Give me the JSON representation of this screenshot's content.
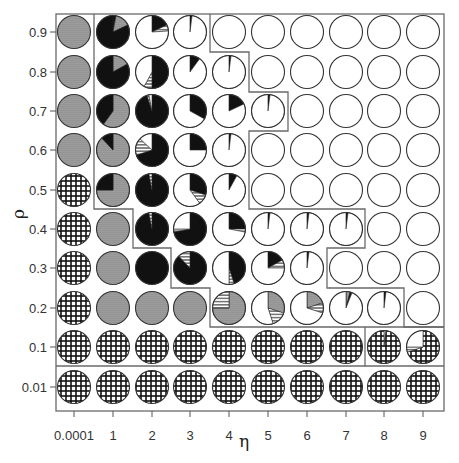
{
  "chart_data": {
    "type": "pie-grid",
    "title": "",
    "xlabel": "η",
    "ylabel": "ρ",
    "x_ticks": [
      "0.0001",
      "1",
      "2",
      "3",
      "4",
      "5",
      "6",
      "7",
      "8",
      "9"
    ],
    "y_ticks": [
      "0.9",
      "0.8",
      "0.7",
      "0.6",
      "0.5",
      "0.4",
      "0.3",
      "0.2",
      "0.1",
      "0.01"
    ],
    "grid": false,
    "legend": null,
    "categories_legend": {
      "white": "open/white slice",
      "black": "solid black slice",
      "gray": "gray slice",
      "hstripe": "horizontal-striped slice",
      "cross": "cross-hatched slice"
    },
    "colors": {
      "white": "#ffffff",
      "black": "#111111",
      "gray": "#9a9a9a",
      "stroke": "#333333",
      "frame": "#666666"
    },
    "note": "Each cell is a pie; slices listed clockwise from 12 o'clock as [category, fraction].",
    "rows": [
      [
        [
          [
            "gray",
            1
          ]
        ],
        [
          [
            "black",
            0.03
          ],
          [
            "gray",
            0.15
          ],
          [
            "black",
            0.82
          ]
        ],
        [
          [
            "black",
            0.18
          ],
          [
            "hstripe",
            0.06
          ],
          [
            "white",
            0.76
          ]
        ],
        [
          [
            "black",
            0.02
          ],
          [
            "white",
            0.98
          ]
        ],
        [
          [
            "white",
            1
          ]
        ],
        [
          [
            "white",
            1
          ]
        ],
        [
          [
            "white",
            1
          ]
        ],
        [
          [
            "white",
            1
          ]
        ],
        [
          [
            "white",
            1
          ]
        ],
        [
          [
            "white",
            1
          ]
        ]
      ],
      [
        [
          [
            "gray",
            1
          ]
        ],
        [
          [
            "gray",
            0.17
          ],
          [
            "black",
            0.83
          ]
        ],
        [
          [
            "black",
            0.5
          ],
          [
            "hstripe",
            0.08
          ],
          [
            "white",
            0.42
          ]
        ],
        [
          [
            "black",
            0.1
          ],
          [
            "white",
            0.9
          ]
        ],
        [
          [
            "black",
            0.02
          ],
          [
            "white",
            0.98
          ]
        ],
        [
          [
            "white",
            1
          ]
        ],
        [
          [
            "white",
            1
          ]
        ],
        [
          [
            "white",
            1
          ]
        ],
        [
          [
            "white",
            1
          ]
        ],
        [
          [
            "white",
            1
          ]
        ]
      ],
      [
        [
          [
            "gray",
            1
          ]
        ],
        [
          [
            "gray",
            0.6
          ],
          [
            "black",
            0.4
          ]
        ],
        [
          [
            "black",
            0.95
          ],
          [
            "hstripe",
            0.02
          ],
          [
            "white",
            0.03
          ]
        ],
        [
          [
            "black",
            0.33
          ],
          [
            "white",
            0.67
          ]
        ],
        [
          [
            "black",
            0.18
          ],
          [
            "white",
            0.82
          ]
        ],
        [
          [
            "black",
            0.02
          ],
          [
            "white",
            0.98
          ]
        ],
        [
          [
            "white",
            1
          ]
        ],
        [
          [
            "white",
            1
          ]
        ],
        [
          [
            "white",
            1
          ]
        ],
        [
          [
            "white",
            1
          ]
        ]
      ],
      [
        [
          [
            "gray",
            1
          ]
        ],
        [
          [
            "gray",
            0.88
          ],
          [
            "black",
            0.12
          ]
        ],
        [
          [
            "black",
            0.7
          ],
          [
            "hstripe",
            0.17
          ],
          [
            "white",
            0.13
          ]
        ],
        [
          [
            "black",
            0.25
          ],
          [
            "white",
            0.75
          ]
        ],
        [
          [
            "black",
            0.02
          ],
          [
            "white",
            0.98
          ]
        ],
        [
          [
            "white",
            1
          ]
        ],
        [
          [
            "white",
            1
          ]
        ],
        [
          [
            "white",
            1
          ]
        ],
        [
          [
            "white",
            1
          ]
        ],
        [
          [
            "white",
            1
          ]
        ]
      ],
      [
        [
          [
            "cross",
            1
          ]
        ],
        [
          [
            "gray",
            0.75
          ],
          [
            "black",
            0.25
          ]
        ],
        [
          [
            "black",
            0.97
          ],
          [
            "hstripe",
            0.03
          ]
        ],
        [
          [
            "black",
            0.3
          ],
          [
            "hstripe",
            0.1
          ],
          [
            "white",
            0.6
          ]
        ],
        [
          [
            "black",
            0.08
          ],
          [
            "white",
            0.92
          ]
        ],
        [
          [
            "white",
            1
          ]
        ],
        [
          [
            "white",
            1
          ]
        ],
        [
          [
            "white",
            1
          ]
        ],
        [
          [
            "white",
            1
          ]
        ],
        [
          [
            "white",
            1
          ]
        ]
      ],
      [
        [
          [
            "cross",
            1
          ]
        ],
        [
          [
            "gray",
            1
          ]
        ],
        [
          [
            "black",
            0.97
          ],
          [
            "hstripe",
            0.03
          ]
        ],
        [
          [
            "black",
            0.72
          ],
          [
            "hstripe",
            0.03
          ],
          [
            "white",
            0.25
          ]
        ],
        [
          [
            "black",
            0.25
          ],
          [
            "hstripe",
            0.03
          ],
          [
            "white",
            0.72
          ]
        ],
        [
          [
            "black",
            0.02
          ],
          [
            "white",
            0.98
          ]
        ],
        [
          [
            "black",
            0.02
          ],
          [
            "white",
            0.98
          ]
        ],
        [
          [
            "black",
            0.02
          ],
          [
            "white",
            0.98
          ]
        ],
        [
          [
            "white",
            1
          ]
        ],
        [
          [
            "white",
            1
          ]
        ]
      ],
      [
        [
          [
            "cross",
            1
          ]
        ],
        [
          [
            "gray",
            1
          ]
        ],
        [
          [
            "black",
            1
          ]
        ],
        [
          [
            "black",
            0.88
          ],
          [
            "hstripe",
            0.12
          ]
        ],
        [
          [
            "black",
            0.45
          ],
          [
            "hstripe",
            0.05
          ],
          [
            "white",
            0.5
          ]
        ],
        [
          [
            "black",
            0.17
          ],
          [
            "hstripe",
            0.08
          ],
          [
            "white",
            0.75
          ]
        ],
        [
          [
            "black",
            0.02
          ],
          [
            "white",
            0.98
          ]
        ],
        [
          [
            "white",
            1
          ]
        ],
        [
          [
            "white",
            1
          ]
        ],
        [
          [
            "white",
            1
          ]
        ]
      ],
      [
        [
          [
            "cross",
            1
          ]
        ],
        [
          [
            "gray",
            1
          ]
        ],
        [
          [
            "gray",
            1
          ]
        ],
        [
          [
            "gray",
            1
          ]
        ],
        [
          [
            "gray",
            0.75
          ],
          [
            "hstripe",
            0.25
          ]
        ],
        [
          [
            "gray",
            0.3
          ],
          [
            "hstripe",
            0.15
          ],
          [
            "white",
            0.55
          ]
        ],
        [
          [
            "gray",
            0.2
          ],
          [
            "hstripe",
            0.1
          ],
          [
            "white",
            0.7
          ]
        ],
        [
          [
            "gray",
            0.04
          ],
          [
            "black",
            0.02
          ],
          [
            "white",
            0.94
          ]
        ],
        [
          [
            "black",
            0.02
          ],
          [
            "white",
            0.98
          ]
        ],
        [
          [
            "white",
            1
          ]
        ]
      ],
      [
        [
          [
            "cross",
            1
          ]
        ],
        [
          [
            "cross",
            1
          ]
        ],
        [
          [
            "cross",
            1
          ]
        ],
        [
          [
            "cross",
            1
          ]
        ],
        [
          [
            "cross",
            1
          ]
        ],
        [
          [
            "cross",
            1
          ]
        ],
        [
          [
            "cross",
            1
          ]
        ],
        [
          [
            "cross",
            1
          ]
        ],
        [
          [
            "white",
            0.02
          ],
          [
            "cross",
            0.98
          ]
        ],
        [
          [
            "cross",
            0.7
          ],
          [
            "hstripe",
            0.05
          ],
          [
            "white",
            0.25
          ]
        ]
      ],
      [
        [
          [
            "cross",
            1
          ]
        ],
        [
          [
            "cross",
            1
          ]
        ],
        [
          [
            "cross",
            1
          ]
        ],
        [
          [
            "cross",
            1
          ]
        ],
        [
          [
            "cross",
            1
          ]
        ],
        [
          [
            "cross",
            1
          ]
        ],
        [
          [
            "cross",
            1
          ]
        ],
        [
          [
            "cross",
            1
          ]
        ],
        [
          [
            "cross",
            1
          ]
        ],
        [
          [
            "cross",
            1
          ]
        ]
      ]
    ],
    "region_boundaries": "Step-shaped gray outlines separate regions of the grid"
  }
}
